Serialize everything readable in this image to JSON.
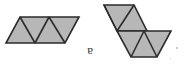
{
  "canvas": {
    "width": 184,
    "height": 74,
    "background": "#ffffff"
  },
  "style": {
    "fill": "#b7b7b7",
    "stroke": "#2b2b2b",
    "stroke_width": 1.6,
    "label_color": "#3a3a3a"
  },
  "label": {
    "text": "a",
    "x": 88,
    "y": 52,
    "rotation_degrees": 180
  },
  "figures": [
    {
      "name": "left-parallelogram-strip",
      "description": "Rhomboid strip of four triangles slanting down-to-the-left",
      "outline": [
        [
          20,
          17
        ],
        [
          79,
          17
        ],
        [
          65,
          43
        ],
        [
          6,
          43
        ]
      ],
      "internal_lines": [
        [
          [
            20,
            17
          ],
          [
            35,
            43
          ]
        ],
        [
          [
            35,
            43
          ],
          [
            49,
            17
          ]
        ],
        [
          [
            49,
            17
          ],
          [
            65,
            43
          ]
        ]
      ],
      "triangle_count": 4
    },
    {
      "name": "right-bent-strip",
      "description": "Chevron of six triangles: upper-left rhomboid joined to lower-right trapezoid",
      "upper_outline": [
        [
          104,
          5
        ],
        [
          134,
          5
        ],
        [
          147,
          31
        ],
        [
          117,
          31
        ]
      ],
      "upper_internal_lines": [
        [
          [
            104,
            5
          ],
          [
            117,
            31
          ]
        ],
        [
          [
            117,
            31
          ],
          [
            134,
            5
          ]
        ]
      ],
      "lower_outline": [
        [
          117,
          31
        ],
        [
          171,
          31
        ],
        [
          157,
          57
        ],
        [
          131,
          57
        ]
      ],
      "lower_internal_lines": [
        [
          [
            131,
            57
          ],
          [
            144,
            31
          ]
        ],
        [
          [
            144,
            31
          ],
          [
            157,
            57
          ]
        ]
      ],
      "triangle_count": 6
    }
  ],
  "specks": [
    {
      "name": "speck-a",
      "x": 176,
      "y": 47
    },
    {
      "name": "speck-b",
      "x": 170,
      "y": 58
    }
  ]
}
